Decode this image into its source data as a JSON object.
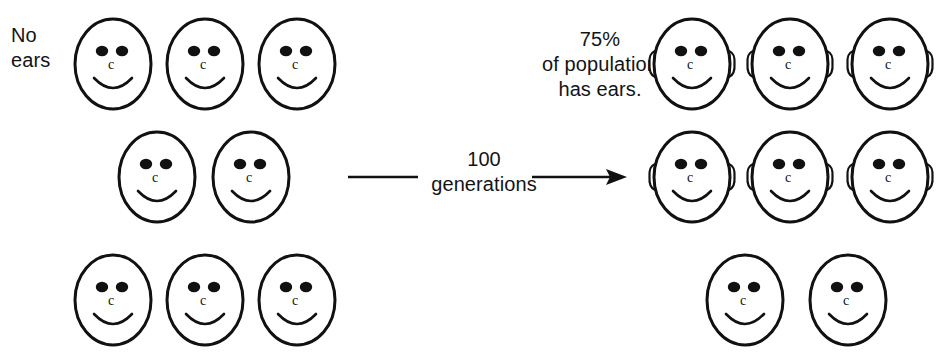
{
  "figure": {
    "title_text_left": "No\nears",
    "labels": {
      "left_group": "No\nears",
      "right_group": "75%\nof population\nhas ears.",
      "arrow": "100\ngenerations"
    },
    "colors": {
      "ink": "#111111",
      "background": "#ffffff"
    }
  },
  "populations": {
    "before": {
      "label": "No ears",
      "ears_fraction": "0%",
      "rows": [
        {
          "count": 3,
          "ears": false,
          "cx": [
            113,
            205,
            297
          ],
          "cy": 64
        },
        {
          "count": 2,
          "ears": false,
          "cx": [
            157,
            251
          ],
          "cy": 177
        },
        {
          "count": 3,
          "ears": false,
          "cx": [
            113,
            205,
            297
          ],
          "cy": 300
        }
      ]
    },
    "after": {
      "label": "75% of population has ears.",
      "ears_fraction": "75%",
      "rows": [
        {
          "count": 3,
          "ears": true,
          "cx": [
            692,
            790,
            890
          ],
          "cy": 64
        },
        {
          "count": 3,
          "ears": true,
          "cx": [
            692,
            790,
            890
          ],
          "cy": 177
        },
        {
          "count": 2,
          "ears": false,
          "cx": [
            745,
            848
          ],
          "cy": 300
        }
      ]
    }
  },
  "arrow": {
    "label_line1": "100",
    "label_line2": "generations",
    "left_segment": {
      "x1": 348,
      "x2": 418,
      "y": 177
    },
    "right_segment": {
      "x1": 532,
      "x2": 612,
      "y": 177
    },
    "head_tip_x": 627,
    "direction": "right"
  },
  "counts": {
    "left_total": 8,
    "right_total": 8,
    "right_with_ears": 6,
    "right_without_ears": 2
  },
  "icons": {
    "face": "smiley-face-icon",
    "ear": "ear-icon",
    "arrow": "right-arrow-icon"
  }
}
